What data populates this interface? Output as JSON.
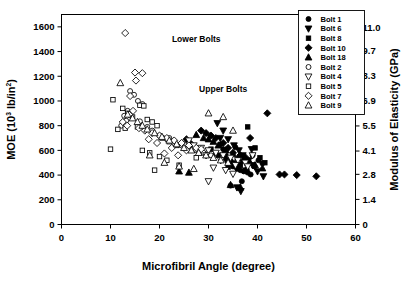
{
  "chart_data": {
    "type": "scatter",
    "title": "",
    "xlabel": "Microfibril Angle (degree)",
    "ylabel": "MOE (10³ lb/in²)",
    "ylabel_main": "MOE (10",
    "ylabel_sup1": "3",
    "ylabel_mid": " lb/in",
    "ylabel_sup2": "2",
    "ylabel_end": ")",
    "y2label": "Modulus of Elasticity (GPa)",
    "xlim": [
      0,
      60
    ],
    "ylim": [
      0,
      1700
    ],
    "y2lim": [
      0,
      11.72
    ],
    "xticks": [
      0,
      10,
      20,
      30,
      40,
      50,
      60
    ],
    "xticklabels": [
      "0",
      "10",
      "20",
      "30",
      "40",
      "50",
      "60"
    ],
    "yticks": [
      0,
      200,
      400,
      600,
      800,
      1000,
      1200,
      1400,
      1600
    ],
    "yticklabels": [
      "0",
      "200",
      "400",
      "600",
      "800",
      "1000",
      "1200",
      "1400",
      "1600"
    ],
    "y2ticks": [
      0,
      1.4,
      2.8,
      4.1,
      5.5,
      6.9,
      8.3,
      9.7,
      11.0
    ],
    "y2ticklabels": [
      "0",
      "1.4",
      "2.8",
      "4.1",
      "5.5",
      "6.9",
      "8.3",
      "9.7",
      "11.0"
    ],
    "grid": false,
    "legend_position": "top-right-outside-plot",
    "annotations": [
      {
        "text": "Lower Bolts",
        "x": 27.5,
        "y": 1480
      },
      {
        "text": "Upper Bolts",
        "x": 33.0,
        "y": 1075
      }
    ],
    "marker_color": "#000000",
    "series": [
      {
        "name": "Bolt 1",
        "marker": "circle",
        "fill": "filled",
        "points": [
          [
            33.5,
            560
          ],
          [
            34.2,
            520
          ],
          [
            35.0,
            470
          ],
          [
            35.8,
            455
          ],
          [
            36.5,
            440
          ],
          [
            37.2,
            430
          ],
          [
            38.0,
            420
          ],
          [
            33.0,
            610
          ],
          [
            34.8,
            500
          ],
          [
            36.0,
            480
          ],
          [
            37.8,
            445
          ],
          [
            38.6,
            405
          ],
          [
            39.4,
            470
          ],
          [
            40.2,
            520
          ],
          [
            36.8,
            350
          ],
          [
            34.5,
            315
          ],
          [
            41.0,
            495
          ],
          [
            39.0,
            560
          ],
          [
            32.5,
            650
          ],
          [
            35.5,
            625
          ]
        ]
      },
      {
        "name": "Bolt 6",
        "marker": "triangle-down",
        "fill": "filled",
        "points": [
          [
            31.8,
            820
          ],
          [
            33.0,
            760
          ],
          [
            34.0,
            690
          ],
          [
            35.2,
            640
          ],
          [
            36.2,
            600
          ],
          [
            37.0,
            560
          ],
          [
            38.2,
            520
          ],
          [
            39.0,
            480
          ],
          [
            40.0,
            430
          ],
          [
            41.2,
            390
          ],
          [
            32.4,
            700
          ],
          [
            35.8,
            300
          ],
          [
            36.6,
            270
          ],
          [
            38.8,
            610
          ],
          [
            33.6,
            520
          ]
        ]
      },
      {
        "name": "Bolt 8",
        "marker": "square",
        "fill": "filled",
        "points": [
          [
            30.5,
            610
          ],
          [
            31.5,
            575
          ],
          [
            33.2,
            540
          ],
          [
            34.5,
            510
          ],
          [
            35.5,
            495
          ],
          [
            36.5,
            480
          ],
          [
            38.0,
            790
          ],
          [
            39.5,
            620
          ],
          [
            40.5,
            540
          ],
          [
            41.5,
            500
          ],
          [
            34.0,
            465
          ],
          [
            36.0,
            450
          ],
          [
            37.5,
            440
          ],
          [
            32.0,
            560
          ]
        ]
      },
      {
        "name": "Bolt 10",
        "marker": "diamond",
        "fill": "filled",
        "points": [
          [
            28.5,
            760
          ],
          [
            29.5,
            740
          ],
          [
            30.5,
            720
          ],
          [
            31.5,
            700
          ],
          [
            33.0,
            660
          ],
          [
            25.5,
            690
          ],
          [
            26.5,
            650
          ],
          [
            27.5,
            620
          ],
          [
            34.0,
            620
          ],
          [
            35.0,
            580
          ],
          [
            36.5,
            560
          ],
          [
            37.5,
            545
          ],
          [
            44.5,
            405
          ],
          [
            45.5,
            405
          ],
          [
            48.0,
            400
          ],
          [
            52.0,
            390
          ],
          [
            42.0,
            900
          ],
          [
            38.5,
            700
          ]
        ]
      },
      {
        "name": "Bolt 18",
        "marker": "triangle-up",
        "fill": "filled",
        "points": [
          [
            27.5,
            725
          ],
          [
            29.0,
            700
          ],
          [
            30.0,
            690
          ],
          [
            31.0,
            670
          ],
          [
            32.0,
            640
          ],
          [
            33.5,
            600
          ],
          [
            35.0,
            570
          ],
          [
            36.0,
            540
          ],
          [
            37.0,
            520
          ],
          [
            38.5,
            500
          ],
          [
            39.5,
            480
          ],
          [
            41.0,
            455
          ],
          [
            24.0,
            430
          ],
          [
            26.0,
            420
          ],
          [
            34.5,
            320
          ],
          [
            36.5,
            300
          ]
        ]
      },
      {
        "name": "Bolt 2",
        "marker": "circle",
        "fill": "open",
        "points": [
          [
            14.0,
            1080
          ],
          [
            14.8,
            1050
          ],
          [
            15.6,
            1000
          ],
          [
            16.5,
            975
          ],
          [
            13.5,
            920
          ],
          [
            12.8,
            880
          ],
          [
            13.2,
            840
          ],
          [
            17.5,
            790
          ],
          [
            18.5,
            760
          ],
          [
            20.0,
            720
          ],
          [
            21.5,
            690
          ],
          [
            23.0,
            660
          ],
          [
            24.5,
            640
          ],
          [
            26.0,
            620
          ],
          [
            27.5,
            600
          ],
          [
            29.0,
            580
          ],
          [
            30.5,
            560
          ],
          [
            12.2,
            800
          ],
          [
            16.0,
            835
          ],
          [
            22.0,
            700
          ],
          [
            25.0,
            650
          ],
          [
            28.0,
            595
          ]
        ]
      },
      {
        "name": "Bolt 4",
        "marker": "triangle-down",
        "fill": "open",
        "points": [
          [
            27.0,
            640
          ],
          [
            28.5,
            620
          ],
          [
            30.0,
            600
          ],
          [
            31.5,
            580
          ],
          [
            33.0,
            560
          ],
          [
            34.5,
            540
          ],
          [
            36.0,
            520
          ],
          [
            37.5,
            500
          ],
          [
            29.5,
            560
          ],
          [
            32.5,
            520
          ],
          [
            35.5,
            480
          ],
          [
            38.0,
            470
          ],
          [
            31.0,
            460
          ],
          [
            33.5,
            440
          ],
          [
            35.0,
            410
          ],
          [
            26.0,
            680
          ],
          [
            39.0,
            560
          ],
          [
            30.0,
            350
          ]
        ]
      },
      {
        "name": "Bolt 5",
        "marker": "square",
        "fill": "open",
        "points": [
          [
            10.5,
            1010
          ],
          [
            12.5,
            940
          ],
          [
            13.5,
            900
          ],
          [
            14.5,
            870
          ],
          [
            16.0,
            965
          ],
          [
            16.8,
            960
          ],
          [
            17.5,
            850
          ],
          [
            18.5,
            830
          ],
          [
            19.5,
            800
          ],
          [
            15.5,
            790
          ],
          [
            13.0,
            780
          ],
          [
            11.5,
            770
          ],
          [
            10.0,
            610
          ],
          [
            20.5,
            700
          ],
          [
            22.0,
            670
          ],
          [
            23.5,
            640
          ],
          [
            16.5,
            600
          ],
          [
            18.0,
            580
          ],
          [
            20.0,
            550
          ],
          [
            21.5,
            520
          ],
          [
            19.0,
            440
          ],
          [
            24.0,
            480
          ],
          [
            27.5,
            540
          ]
        ]
      },
      {
        "name": "Bolt 7",
        "marker": "diamond",
        "fill": "open",
        "points": [
          [
            13.0,
            1550
          ],
          [
            15.0,
            1230
          ],
          [
            16.5,
            1225
          ],
          [
            15.2,
            1165
          ],
          [
            14.0,
            1040
          ],
          [
            14.6,
            920
          ],
          [
            13.8,
            890
          ],
          [
            13.4,
            800
          ],
          [
            15.8,
            780
          ],
          [
            17.0,
            760
          ],
          [
            18.5,
            740
          ],
          [
            20.0,
            720
          ],
          [
            21.5,
            700
          ],
          [
            23.0,
            680
          ],
          [
            24.5,
            660
          ],
          [
            26.0,
            640
          ],
          [
            27.5,
            620
          ],
          [
            22.5,
            620
          ],
          [
            19.5,
            660
          ],
          [
            17.8,
            690
          ],
          [
            12.5,
            830
          ],
          [
            28.5,
            610
          ],
          [
            25.5,
            600
          ],
          [
            21.0,
            575
          ],
          [
            23.8,
            560
          ]
        ]
      },
      {
        "name": "Bolt 9",
        "marker": "triangle-up",
        "fill": "open",
        "points": [
          [
            12.0,
            1145
          ],
          [
            13.5,
            890
          ],
          [
            14.5,
            860
          ],
          [
            15.5,
            830
          ],
          [
            16.5,
            800
          ],
          [
            17.5,
            770
          ],
          [
            19.0,
            740
          ],
          [
            20.5,
            710
          ],
          [
            22.0,
            680
          ],
          [
            23.5,
            650
          ],
          [
            25.0,
            620
          ],
          [
            26.5,
            600
          ],
          [
            28.0,
            580
          ],
          [
            29.5,
            560
          ],
          [
            31.0,
            540
          ],
          [
            32.5,
            520
          ],
          [
            34.0,
            500
          ],
          [
            30.0,
            900
          ],
          [
            33.0,
            870
          ],
          [
            35.0,
            760
          ],
          [
            18.0,
            560
          ],
          [
            21.0,
            500
          ],
          [
            24.0,
            470
          ],
          [
            27.0,
            450
          ]
        ]
      }
    ],
    "legend_entries": [
      {
        "label": "Bolt 1",
        "marker": "circle",
        "fill": "filled"
      },
      {
        "label": "Bolt 6",
        "marker": "triangle-down",
        "fill": "filled"
      },
      {
        "label": "Bolt 8",
        "marker": "square",
        "fill": "filled"
      },
      {
        "label": "Bolt 10",
        "marker": "diamond",
        "fill": "filled"
      },
      {
        "label": "Bolt 18",
        "marker": "triangle-up",
        "fill": "filled"
      },
      {
        "label": "Bolt 2",
        "marker": "circle",
        "fill": "open"
      },
      {
        "label": "Bolt 4",
        "marker": "triangle-down",
        "fill": "open"
      },
      {
        "label": "Bolt 5",
        "marker": "square",
        "fill": "open"
      },
      {
        "label": "Bolt 7",
        "marker": "diamond",
        "fill": "open"
      },
      {
        "label": "Bolt 9",
        "marker": "triangle-up",
        "fill": "open"
      }
    ]
  }
}
